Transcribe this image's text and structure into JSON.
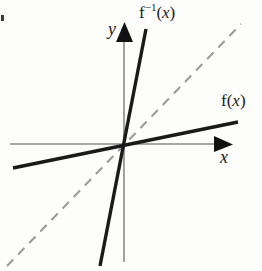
{
  "figure": {
    "background_color": "#fdfdfb",
    "width": 262,
    "height": 271
  },
  "axes": {
    "origin": {
      "x": 124,
      "y": 144
    },
    "color": "#8a8a8a",
    "arrow_color": "#111111",
    "x_axis": {
      "label": "x",
      "start": {
        "x": 10,
        "y": 144
      },
      "end": {
        "x": 232,
        "y": 144
      },
      "arrow": "right"
    },
    "y_axis": {
      "label": "y",
      "start": {
        "x": 124,
        "y": 262
      },
      "end": {
        "x": 124,
        "y": 22
      },
      "arrow": "up"
    }
  },
  "curves": [
    {
      "name": "f",
      "label": "f(x)",
      "label_prefix": "f(",
      "label_arg": "x",
      "label_suffix": ")",
      "style": "solid",
      "color": "#1a1a1a",
      "width": 3.4,
      "from": {
        "x": 13,
        "y": 168
      },
      "to": {
        "x": 238,
        "y": 122
      },
      "slope_description": "shallow positive slope"
    },
    {
      "name": "f-inverse",
      "label": "f−1(x)",
      "label_prefix": "f",
      "label_exponent": "−1",
      "label_arg": "x",
      "label_suffix": ")",
      "label_open": "(",
      "style": "solid",
      "color": "#1a1a1a",
      "width": 3.4,
      "from": {
        "x": 100,
        "y": 266
      },
      "to": {
        "x": 146,
        "y": 29
      },
      "slope_description": "steep positive slope"
    },
    {
      "name": "identity-line",
      "label": "y = x",
      "style": "dashed",
      "color": "#9a9a9a",
      "width": 2,
      "dash": "9,7",
      "from": {
        "x": 7,
        "y": 266
      },
      "to": {
        "x": 241,
        "y": 24
      },
      "slope_description": "45 degree reflection axis"
    }
  ],
  "labels": {
    "f_inverse": {
      "base": "f",
      "exponent": "−1",
      "open_paren": "(",
      "arg": "x",
      "close_paren": ")"
    },
    "f": {
      "base": "f",
      "open_paren": "(",
      "arg": "x",
      "close_paren": ")"
    },
    "y_axis": "y",
    "x_axis": "x"
  }
}
